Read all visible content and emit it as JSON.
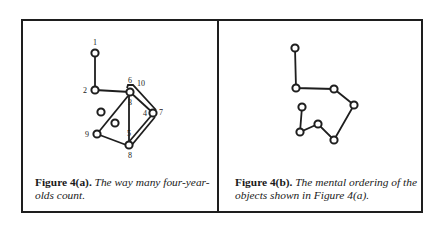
{
  "figure_a": {
    "caption_label": "Figure 4(a).",
    "caption_text": "The way many four-year-olds count.",
    "node_labels": [
      "1",
      "2",
      "6",
      "10",
      "3",
      "4",
      "7",
      "9",
      "5",
      "8"
    ]
  },
  "figure_b": {
    "caption_label": "Figure 4(b).",
    "caption_text": "The mental ordering of the objects shown in Figure 4(a)."
  },
  "colors": {
    "ink": "#1e1e1e",
    "background": "#ffffff"
  }
}
